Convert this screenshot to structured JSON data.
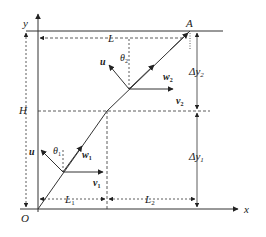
{
  "diagram": {
    "type": "trajectory-velocity-decomposition",
    "axes": {
      "x_label": "x",
      "y_label": "y",
      "origin_label": "O"
    },
    "points": {
      "end_label": "A"
    },
    "dimensions": {
      "total_width": "L",
      "height": "H",
      "segment1_width": "L",
      "segment1_width_sub": "1",
      "segment2_width": "L",
      "segment2_width_sub": "2",
      "dy1": "Δy",
      "dy1_sub": "1",
      "dy2": "Δy",
      "dy2_sub": "2"
    },
    "vectors": {
      "lower": {
        "u": "u",
        "w": "w",
        "w_sub": "1",
        "v": "v",
        "v_sub": "1",
        "theta": "θ",
        "theta_sub": "1"
      },
      "upper": {
        "u": "u",
        "w": "w",
        "w_sub": "2",
        "v": "v",
        "v_sub": "2",
        "theta": "θ",
        "theta_sub": "2"
      }
    },
    "colors": {
      "line": "#333333",
      "background": "#ffffff"
    }
  }
}
